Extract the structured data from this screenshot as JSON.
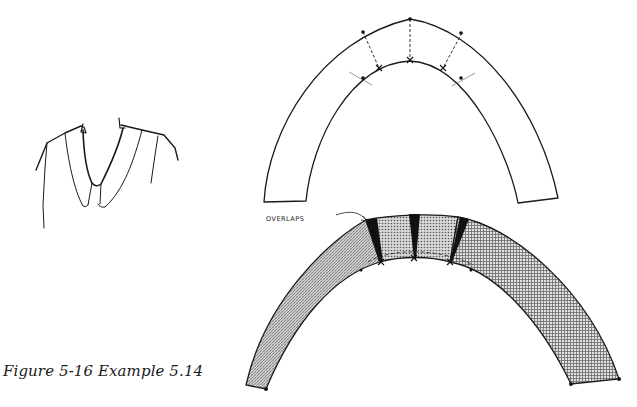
{
  "caption": "Figure 5-16  Example 5.14",
  "annotations": {
    "overlaps_label": "OVERLAPS"
  },
  "figure": {
    "collar_sketch": "Peter Pan style collar on bodice neckline",
    "upper_pattern": "Collar pattern piece with slash lines (dashed) and matching notches",
    "lower_pattern": "Collar pattern after closing, showing overlapped wedges (black) at slash lines",
    "colors": {
      "line": "#1a1a1a",
      "overlap_fill": "#111111",
      "fabric_left": "#b8b8b8",
      "fabric_right": "#c4c4c4",
      "background": "#ffffff"
    }
  }
}
